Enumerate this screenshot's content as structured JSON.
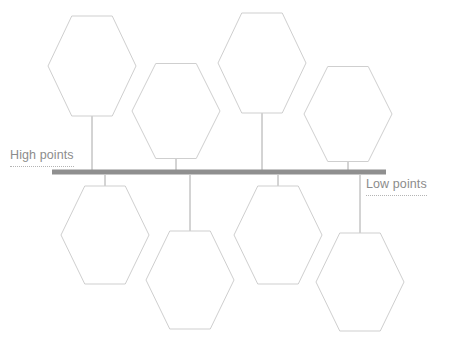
{
  "diagram": {
    "type": "hexagon-timeline",
    "axis": {
      "orientation": "horizontal",
      "color": "#8f8f8f",
      "x_start": 52,
      "x_end": 386,
      "y": 172,
      "thickness": 5
    },
    "labels": {
      "high": "High points",
      "low": "Low points",
      "color": "#8c8c8c",
      "underline_style": "dotted"
    },
    "hexagon_style": {
      "stroke": "#cfcfcf",
      "fill": "#ffffff",
      "stroke_width": 1
    },
    "stem_style": {
      "stroke": "#a8a8a8",
      "stroke_width": 1
    },
    "nodes_above": [
      {
        "id": "above-1",
        "cx": 92,
        "cy": 66,
        "width": 88,
        "height": 100,
        "stem_from": 116,
        "stem_to": 172
      },
      {
        "id": "above-2",
        "cx": 176,
        "cy": 111,
        "width": 88,
        "height": 95,
        "stem_from": 158,
        "stem_to": 172
      },
      {
        "id": "above-3",
        "cx": 262,
        "cy": 63,
        "width": 88,
        "height": 100,
        "stem_from": 113,
        "stem_to": 172
      },
      {
        "id": "above-4",
        "cx": 348,
        "cy": 114,
        "width": 88,
        "height": 95,
        "stem_from": 161,
        "stem_to": 172
      }
    ],
    "nodes_below": [
      {
        "id": "below-1",
        "cx": 105,
        "cy": 235,
        "width": 88,
        "height": 98,
        "stem_from": 175,
        "stem_to": 187
      },
      {
        "id": "below-2",
        "cx": 190,
        "cy": 280,
        "width": 88,
        "height": 98,
        "stem_from": 175,
        "stem_to": 232
      },
      {
        "id": "below-3",
        "cx": 278,
        "cy": 235,
        "width": 88,
        "height": 98,
        "stem_from": 175,
        "stem_to": 187
      },
      {
        "id": "below-4",
        "cx": 360,
        "cy": 282,
        "width": 88,
        "height": 98,
        "stem_from": 175,
        "stem_to": 234
      }
    ]
  }
}
